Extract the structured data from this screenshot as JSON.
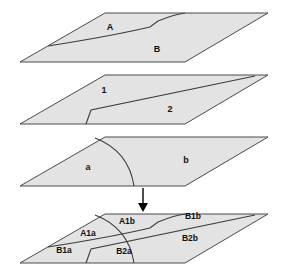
{
  "figure": {
    "title": "",
    "plane_fill_color": "#e3e3e3",
    "plane_stroke_color": "#4a4a4a",
    "divider_color": "#3c3c3c",
    "arrow_color": "#000000",
    "background_color": "#ffffff"
  },
  "planes": [
    {
      "id": "plane-a-b",
      "order": 1,
      "labels": [
        {
          "name": "label-A",
          "text": "A",
          "x": 110,
          "y": 30
        },
        {
          "name": "label-B",
          "text": "B",
          "x": 157,
          "y": 52
        }
      ]
    },
    {
      "id": "plane-1-2",
      "order": 2,
      "labels": [
        {
          "name": "label-1",
          "text": "1",
          "x": 104,
          "y": 93
        },
        {
          "name": "label-2",
          "text": "2",
          "x": 170,
          "y": 112
        }
      ]
    },
    {
      "id": "plane-a-b-lower",
      "order": 3,
      "labels": [
        {
          "name": "label-a",
          "text": "a",
          "x": 88,
          "y": 170
        },
        {
          "name": "label-b",
          "text": "b",
          "x": 186,
          "y": 163
        }
      ]
    },
    {
      "id": "plane-overlay",
      "order": 4,
      "labels": [
        {
          "name": "label-A1a",
          "text": "A1a",
          "x": 88,
          "y": 236
        },
        {
          "name": "label-A1b",
          "text": "A1b",
          "x": 127,
          "y": 224
        },
        {
          "name": "label-B1a",
          "text": "B1a",
          "x": 64,
          "y": 253
        },
        {
          "name": "label-B1b",
          "text": "B1b",
          "x": 193,
          "y": 219
        },
        {
          "name": "label-B2a",
          "text": "B2a",
          "x": 124,
          "y": 254
        },
        {
          "name": "label-B2b",
          "text": "B2b",
          "x": 190,
          "y": 241
        }
      ]
    }
  ],
  "arrow": {
    "name": "downward-arrow",
    "x": 143,
    "y_start": 188,
    "y_end": 211
  }
}
